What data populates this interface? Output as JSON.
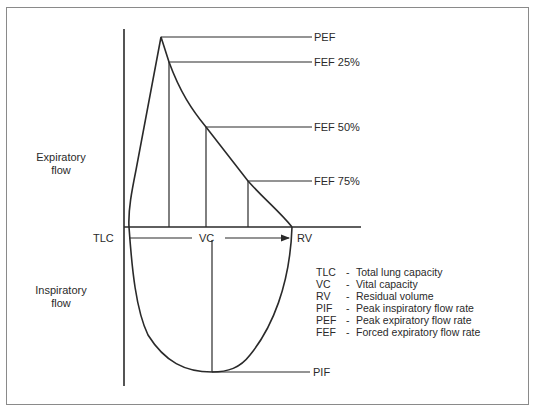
{
  "figure": {
    "axis_labels": {
      "expiratory": [
        "Expiratory",
        "flow"
      ],
      "inspiratory": [
        "Inspiratory",
        "flow"
      ],
      "tlc": "TLC",
      "vc": "VC",
      "rv": "RV"
    },
    "point_labels": {
      "pef": "PEF",
      "fef25": "FEF 25%",
      "fef50": "FEF 50%",
      "fef75": "FEF 75%",
      "pif": "PIF"
    },
    "legend": [
      {
        "abbr": "TLC",
        "desc": "Total lung capacity"
      },
      {
        "abbr": "VC",
        "desc": "Vital capacity"
      },
      {
        "abbr": "RV",
        "desc": "Residual volume"
      },
      {
        "abbr": "PIF",
        "desc": "Peak inspiratory flow rate"
      },
      {
        "abbr": "PEF",
        "desc": "Peak expiratory flow rate"
      },
      {
        "abbr": "FEF",
        "desc": "Forced expiratory flow rate"
      }
    ],
    "colors": {
      "line": "#2a2a2a",
      "frame": "#8a8a8a",
      "background": "#ffffff"
    }
  }
}
